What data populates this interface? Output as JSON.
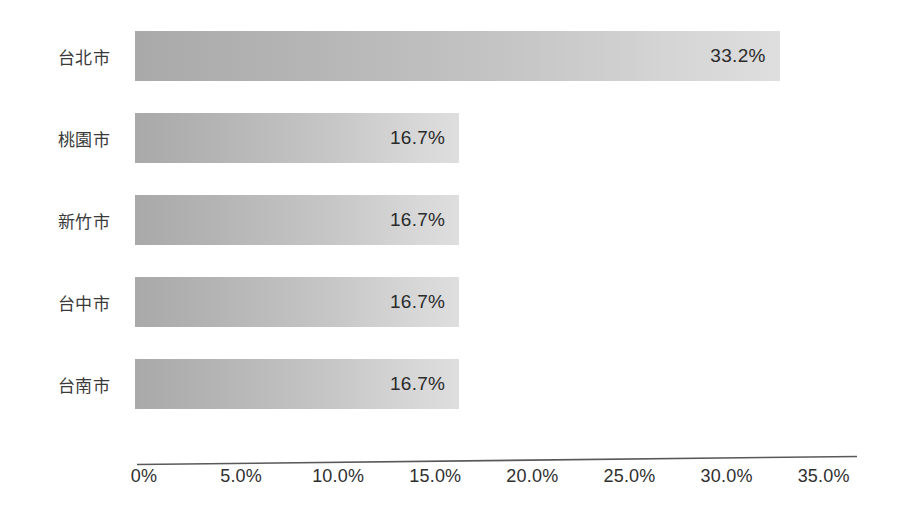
{
  "chart_data": {
    "type": "bar",
    "orientation": "horizontal",
    "title": "",
    "subtitle": "",
    "xlabel": "",
    "ylabel": "",
    "categories": [
      "台北市",
      "桃園市",
      "新竹市",
      "台中市",
      "台南市"
    ],
    "values": [
      33.2,
      16.7,
      16.7,
      16.7,
      16.7
    ],
    "data_labels": [
      "33.2%",
      "16.7%",
      "16.7%",
      "16.7%",
      "16.7%"
    ],
    "xlim": [
      0,
      35
    ],
    "xticks": [
      0,
      5,
      10,
      15,
      20,
      25,
      30,
      35
    ],
    "xtick_labels": [
      "0%",
      "5.0%",
      "10.0%",
      "15.0%",
      "20.0%",
      "25.0%",
      "30.0%",
      "35.0%"
    ],
    "grid": false,
    "legend": null,
    "legend_position": "none",
    "bar_fill_start": "#a9a9a9",
    "bar_fill_end": "#dedede",
    "label_text_color": "#2b2b2b",
    "axis_line_color": "#595959",
    "background_color": "#ffffff"
  },
  "bars": [
    {
      "category": "台北市",
      "value": 33.2,
      "label": "33.2%"
    },
    {
      "category": "桃園市",
      "value": 16.7,
      "label": "16.7%"
    },
    {
      "category": "新竹市",
      "value": 16.7,
      "label": "16.7%"
    },
    {
      "category": "台中市",
      "value": 16.7,
      "label": "16.7%"
    },
    {
      "category": "台南市",
      "value": 16.7,
      "label": "16.7%"
    }
  ],
  "axis": {
    "ticks": [
      {
        "label": "0%",
        "value": 0
      },
      {
        "label": "5.0%",
        "value": 5
      },
      {
        "label": "10.0%",
        "value": 10
      },
      {
        "label": "15.0%",
        "value": 15
      },
      {
        "label": "20.0%",
        "value": 20
      },
      {
        "label": "25.0%",
        "value": 25
      },
      {
        "label": "30.0%",
        "value": 30
      },
      {
        "label": "35.0%",
        "value": 35
      }
    ]
  }
}
